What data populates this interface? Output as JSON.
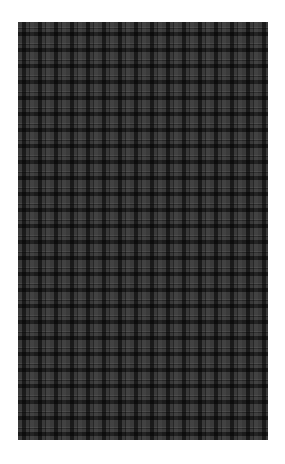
{
  "image": {
    "subject": "dark grey plaid fabric swatch",
    "colors": {
      "background": "#ffffff",
      "base": "#3a3a3a",
      "dark_stripe": "#1a1a1a",
      "light_stripe": "#4a4a4a"
    }
  }
}
